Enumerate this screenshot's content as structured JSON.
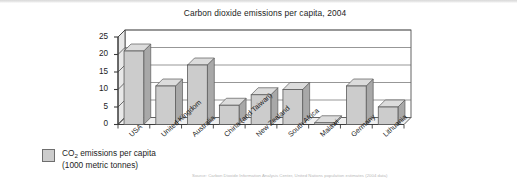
{
  "chart_data": {
    "type": "bar",
    "title": "Carbon dioxide emissions per capita, 2004",
    "xlabel": "",
    "ylabel": "",
    "ylim": [
      0,
      25
    ],
    "yticks": [
      0,
      5,
      10,
      15,
      20,
      25
    ],
    "grid": true,
    "legend_position": "below-left",
    "categories": [
      "USA",
      "United Kingdom",
      "Australia",
      "China (and Taiwan)",
      "New Zealand",
      "South Africa",
      "Malawi",
      "Germany",
      "Lithuania"
    ],
    "series": [
      {
        "name": "CO₂ emissions per capita (1000 metric tonnes)",
        "values": [
          21.0,
          11.0,
          17.0,
          5.5,
          8.5,
          10.0,
          0.5,
          11.0,
          5.0
        ]
      }
    ],
    "source": "Source: Carbon Dioxide Information Analysis Center, United Nations population estimates (2004 data)"
  },
  "legend": {
    "swatch_name": "legend-swatch",
    "line1_prefix": "CO",
    "line1_sub": "2",
    "line1_suffix": " emissions per capita",
    "line2": "(1000 metric tonnes)"
  },
  "colors": {
    "bar_face": "#cccccc",
    "bar_top": "#dcdcdc",
    "bar_side": "#a8a8a8",
    "bar_outline": "#5a5a5a",
    "plot_back": "#ffffff",
    "plot_floor": "#efefef",
    "plot_wall": "#e8e8e8",
    "gridline": "#6a6a6a",
    "axis": "#3c3c3c",
    "text": "#1d1d1d",
    "source_text": "#b9b9b9"
  }
}
